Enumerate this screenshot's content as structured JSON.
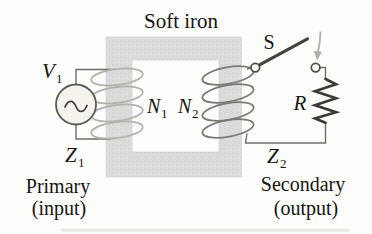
{
  "figure": {
    "core_label": "Soft iron",
    "switch_label": "S",
    "resistor_label": "R",
    "source_voltage": {
      "base": "V",
      "sub": "1"
    },
    "primary_impedance": {
      "base": "Z",
      "sub": "1"
    },
    "secondary_impedance": {
      "base": "Z",
      "sub": "2"
    },
    "primary_turns": {
      "base": "N",
      "sub": "1"
    },
    "secondary_turns": {
      "base": "N",
      "sub": "2"
    },
    "primary_caption": {
      "line1": "Primary",
      "line2": "(input)"
    },
    "secondary_caption": {
      "line1": "Secondary",
      "line2": "(output)"
    }
  },
  "colors": {
    "page_bg": "#fdfdfb",
    "core_fill": "#dddddd",
    "core_stipple": "#c9c9c9",
    "wire": "#6f6d69",
    "primary_coil": "#b3b1ac",
    "secondary_coil": "#7b7975",
    "component_dark": "#3c3a36",
    "switch_blade": "#45433f",
    "arrow_gray": "#b2b0aa",
    "source_fill": "#f6f3ec",
    "text": "#161514"
  }
}
